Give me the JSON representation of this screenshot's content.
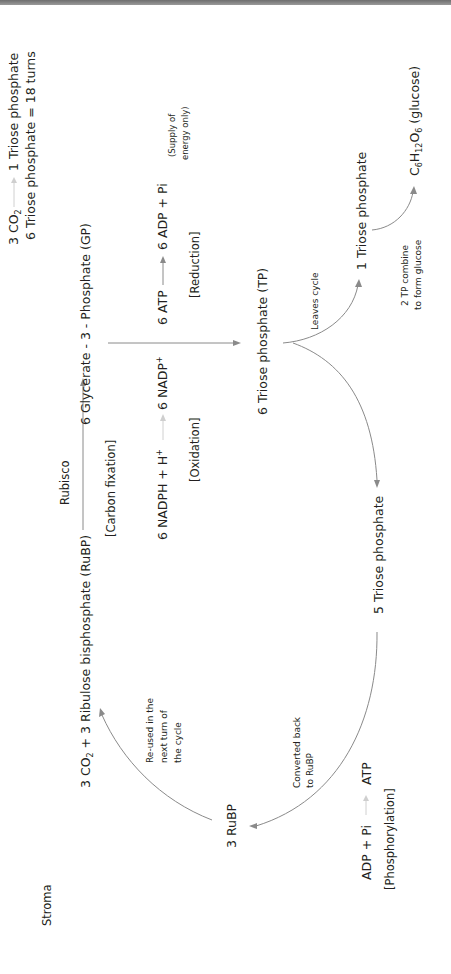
{
  "diagram": {
    "orientation": "rotated 90 degrees counter-clockwise",
    "colors": {
      "text": "#231f20",
      "arrow": "#8a8a8a",
      "faint_arrow": "#d0d0d0",
      "top_bar": "#7a7a7a"
    },
    "summary": {
      "line1_left": "3 CO",
      "line1_left_sub": "2",
      "line1_right": "1 Triose phosphate",
      "line2": "6 Triose phosphate = 18 turns"
    },
    "region_label": "Stroma",
    "fixation": {
      "reactants_prefix": "3 CO",
      "reactants_sub": "2",
      "reactants_suffix": " + 3 Ribulose bisphosphate (RuBP)",
      "enzyme": "Rubisco",
      "stage": "[Carbon fixation]",
      "product": "6 Glycerate - 3 - Phosphate (GP)"
    },
    "reduction": {
      "nadph": "6 NADPH + H",
      "nadph_sup": "+",
      "nadp": "6 NADP",
      "nadp_sup": "+",
      "oxidation_label": "[Oxidation]",
      "atp": "6 ATP",
      "adp": "6 ADP + Pi",
      "reduction_label": "[Reduction]",
      "note_line1": "(Supply of",
      "note_line2": "energy only)"
    },
    "triose": {
      "main": "6 Triose phosphate (TP)",
      "leaves_label": "Leaves cycle",
      "one_tp": "1 Triose phosphate",
      "combine_line1": "2 TP combine",
      "combine_line2": "to form glucose",
      "glucose_c": "C",
      "glucose_c_sub": "6",
      "glucose_h": "H",
      "glucose_h_sub": "12",
      "glucose_o": "O",
      "glucose_o_sub": "6",
      "glucose_name": " (glucose)",
      "five_tp": "5 Triose phosphate"
    },
    "regeneration": {
      "reused_line1": "Re-used in the",
      "reused_line2": "next turn of",
      "reused_line3": "the cycle",
      "converted_line1": "Converted back",
      "converted_line2": "to RuBP",
      "rubp": "3 RuBP",
      "adp": "ADP + Pi",
      "atp": "ATP",
      "stage": "[Phosphorylation]"
    }
  }
}
